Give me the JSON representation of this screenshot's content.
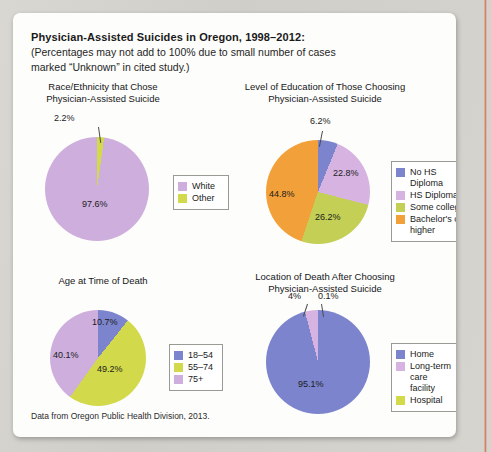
{
  "page": {
    "title_main": "Physician-Assisted Suicides in Oregon, 1998–2012:",
    "title_sub_line1": "(Percentages may not add to 100% due to small number of cases",
    "title_sub_line2": "marked “Unknown” in cited study.)",
    "source": "Data from Oregon Public Health Division, 2013."
  },
  "colors": {
    "purple_light": "#ceaedd",
    "purple_pale": "#d6b3e0",
    "yellow_green": "#d4d council",
    "green": "#d2d94a",
    "blue": "#7b84cc",
    "orange": "#f2a13a",
    "some_college": "#c3cf55"
  },
  "chart_data": [
    {
      "id": "race-ethnicity",
      "type": "pie",
      "title": "Race/Ethnicity that Chose\nPhysician-Assisted Suicide",
      "title_line1": "Race/Ethnicity that Chose",
      "title_line2": "Physician-Assisted Suicide",
      "categories": [
        "White",
        "Other"
      ],
      "values": [
        97.6,
        2.2
      ],
      "labels": [
        "97.6%",
        "2.2%"
      ],
      "colors": [
        "#ceaedd",
        "#d2d94a"
      ],
      "legend_position": "right"
    },
    {
      "id": "education-level",
      "type": "pie",
      "title": "Level of Education of Those Choosing\nPhysician-Assisted Suicide",
      "title_line1": "Level of Education of Those Choosing",
      "title_line2": "Physician-Assisted Suicide",
      "categories": [
        "No HS Diploma",
        "HS Diploma",
        "Some college",
        "Bachelor's or\nhigher"
      ],
      "values": [
        6.2,
        22.8,
        26.2,
        44.8
      ],
      "labels": [
        "6.2%",
        "22.8%",
        "26.2%",
        "44.8%"
      ],
      "colors": [
        "#7b84cc",
        "#d6b3e0",
        "#c3cf55",
        "#f2a13a"
      ],
      "legend_position": "right"
    },
    {
      "id": "age-at-death",
      "type": "pie",
      "title": "Age at Time of Death",
      "title_line1": "Age at Time of Death",
      "title_line2": "",
      "categories": [
        "18–54",
        "55–74",
        "75+"
      ],
      "values": [
        10.7,
        49.2,
        40.1
      ],
      "labels": [
        "10.7%",
        "49.2%",
        "40.1%"
      ],
      "colors": [
        "#7b84cc",
        "#d2d94a",
        "#ceaedd"
      ],
      "legend_position": "right"
    },
    {
      "id": "location-of-death",
      "type": "pie",
      "title": "Location of Death After Choosing\nPhysician-Assisted Suicide",
      "title_line1": "Location of Death After Choosing",
      "title_line2": "Physician-Assisted Suicide",
      "categories": [
        "Home",
        "Long-term care\nfacility",
        "Hospital"
      ],
      "values": [
        95.1,
        4.0,
        0.1
      ],
      "labels": [
        "95.1%",
        "4%",
        "0.1%"
      ],
      "colors": [
        "#7b84cc",
        "#d6b3e0",
        "#d2d94a"
      ],
      "legend_position": "right"
    }
  ]
}
